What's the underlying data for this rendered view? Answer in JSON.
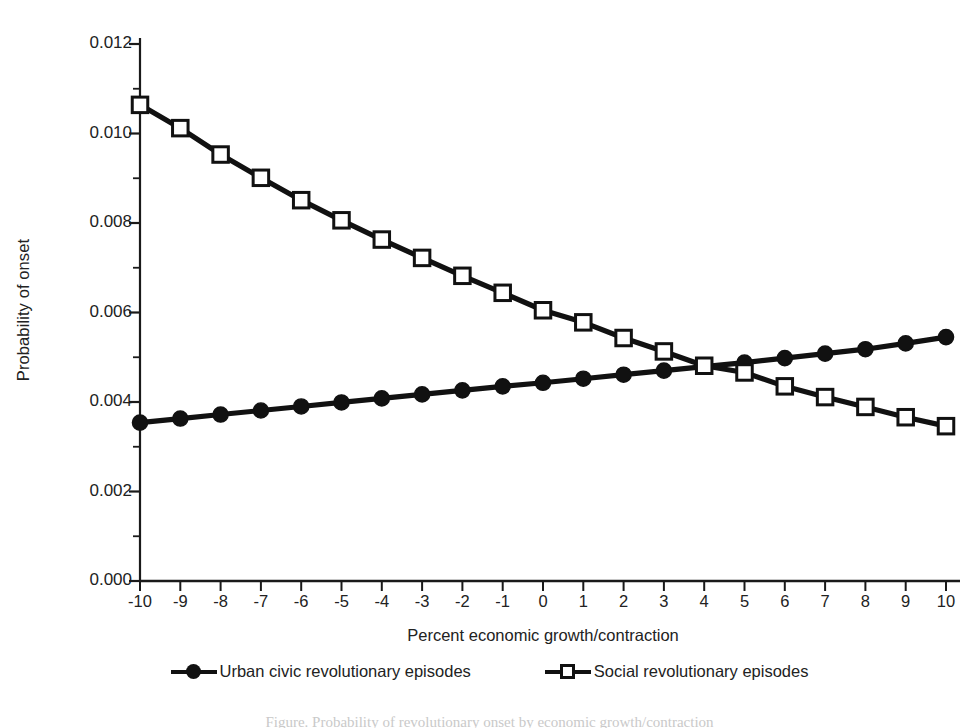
{
  "chart_data": {
    "type": "line",
    "title": "",
    "xlabel": "Percent economic growth/contraction",
    "ylabel": "Probability of onset",
    "x": [
      -10,
      -9,
      -8,
      -7,
      -6,
      -5,
      -4,
      -3,
      -2,
      -1,
      0,
      1,
      2,
      3,
      4,
      5,
      6,
      7,
      8,
      9,
      10
    ],
    "xlim": [
      -10,
      10
    ],
    "ylim": [
      0.0,
      0.012
    ],
    "xticks": [
      "-10",
      "-9",
      "-8",
      "-7",
      "-6",
      "-5",
      "-4",
      "-3",
      "-2",
      "-1",
      "0",
      "1",
      "2",
      "3",
      "4",
      "5",
      "6",
      "7",
      "8",
      "9",
      "10"
    ],
    "yticks": [
      "0.000",
      "0.002",
      "0.004",
      "0.006",
      "0.008",
      "0.010",
      "0.012"
    ],
    "ytick_values": [
      0.0,
      0.002,
      0.004,
      0.006,
      0.008,
      0.01,
      0.012
    ],
    "yminor_values": [
      0.001,
      0.003,
      0.005,
      0.007,
      0.009,
      0.011
    ],
    "grid": false,
    "legend_position": "bottom",
    "series": [
      {
        "name": "Urban civic revolutionary episodes",
        "marker": "filled-circle",
        "color": "#111111",
        "values": [
          0.00354,
          0.00363,
          0.00372,
          0.00381,
          0.0039,
          0.00399,
          0.00408,
          0.00417,
          0.00426,
          0.00435,
          0.00443,
          0.00452,
          0.00461,
          0.0047,
          0.00479,
          0.00488,
          0.00498,
          0.00508,
          0.00518,
          0.00531,
          0.00545
        ]
      },
      {
        "name": "Social revolutionary episodes",
        "marker": "open-square",
        "color": "#111111",
        "values": [
          0.01064,
          0.01012,
          0.00953,
          0.00901,
          0.00851,
          0.00806,
          0.00763,
          0.00722,
          0.00682,
          0.00644,
          0.00605,
          0.00578,
          0.00543,
          0.00513,
          0.00481,
          0.00466,
          0.00435,
          0.00411,
          0.00389,
          0.00366,
          0.00346
        ]
      }
    ]
  },
  "axes": {
    "y_title": "Probability of onset",
    "x_title": "Percent economic growth/contraction"
  },
  "legend": {
    "entries": [
      {
        "label": "Urban civic revolutionary episodes",
        "marker": "filled-circle"
      },
      {
        "label": "Social revolutionary episodes",
        "marker": "open-square"
      }
    ]
  },
  "caption": {
    "text": "Figure. Probability of revolutionary onset by economic growth/contraction"
  }
}
